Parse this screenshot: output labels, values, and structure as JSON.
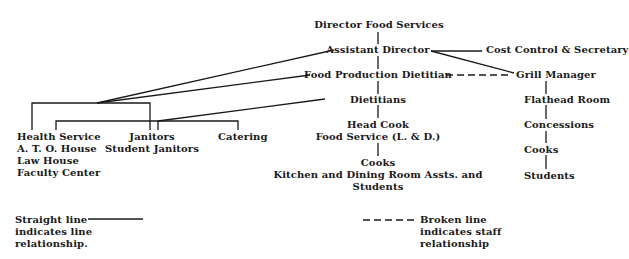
{
  "chart": {
    "type": "organizational-chart",
    "nodes": {
      "director": {
        "label": "Director Food Services"
      },
      "assistant_director": {
        "label": "Assistant Director"
      },
      "cost_control": {
        "label": "Cost Control & Secretary"
      },
      "food_production_dietitian": {
        "label": "Food Production Dietitian"
      },
      "grill_manager": {
        "label": "Grill Manager"
      },
      "dietitians": {
        "label": "Dietitians"
      },
      "flathead_room": {
        "label": "Flathead Room"
      },
      "head_cook": {
        "lines": [
          "Head Cook",
          "Food Service (L. & D.)"
        ]
      },
      "concessions": {
        "label": "Concessions"
      },
      "cooks_main": {
        "lines": [
          "Cooks",
          "Kitchen and Dining Room Assts. and",
          "Students"
        ]
      },
      "cooks_grill": {
        "label": "Cooks"
      },
      "students_grill": {
        "label": "Students"
      },
      "health_service": {
        "lines": [
          "Health Service",
          "A. T. O. House",
          "Law House",
          "Faculty Center"
        ]
      },
      "janitors": {
        "lines": [
          "Janitors",
          "Student Janitors"
        ]
      },
      "catering": {
        "label": "Catering"
      }
    },
    "relationships": [
      {
        "from": "director",
        "to": "assistant_director",
        "type": "line"
      },
      {
        "from": "assistant_director",
        "to": "cost_control",
        "type": "line"
      },
      {
        "from": "assistant_director",
        "to": "grill_manager",
        "type": "line"
      },
      {
        "from": "assistant_director",
        "to": "food_production_dietitian",
        "type": "line"
      },
      {
        "from": "food_production_dietitian",
        "to": "grill_manager",
        "type": "staff"
      },
      {
        "from": "assistant_director",
        "to": "health_service",
        "type": "line"
      },
      {
        "from": "assistant_director",
        "to": "janitors",
        "type": "line"
      },
      {
        "from": "food_production_dietitian",
        "to": "health_service",
        "type": "line"
      },
      {
        "from": "food_production_dietitian",
        "to": "janitors",
        "type": "line"
      },
      {
        "from": "food_production_dietitian",
        "to": "dietitians",
        "type": "line"
      },
      {
        "from": "dietitians",
        "to": "health_service",
        "type": "line"
      },
      {
        "from": "dietitians",
        "to": "catering",
        "type": "line"
      },
      {
        "from": "dietitians",
        "to": "head_cook",
        "type": "line"
      },
      {
        "from": "head_cook",
        "to": "cooks_main",
        "type": "line"
      },
      {
        "from": "grill_manager",
        "to": "flathead_room",
        "type": "line"
      },
      {
        "from": "flathead_room",
        "to": "concessions",
        "type": "line"
      },
      {
        "from": "concessions",
        "to": "cooks_grill",
        "type": "line"
      },
      {
        "from": "cooks_grill",
        "to": "students_grill",
        "type": "line"
      }
    ]
  },
  "legend": {
    "straight": {
      "lines": [
        "Straight line",
        "indicates line",
        "relationship."
      ]
    },
    "broken": {
      "lines": [
        "Broken line",
        "indicates staff",
        "relationship"
      ]
    }
  }
}
